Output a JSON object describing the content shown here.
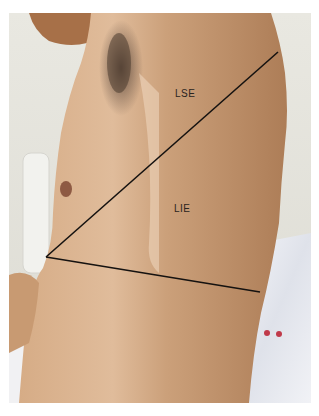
{
  "figure": {
    "labels": {
      "upper_region": "LSE",
      "lower_region": "LIE"
    },
    "colors": {
      "skin": "#c59a74",
      "skin_light": "#ddb896",
      "skin_shadow": "#a57650",
      "background_wall": "#e6e5dd",
      "sheet": "#eef0f5",
      "line": "#151210",
      "hair": "#4a3a2e"
    }
  }
}
